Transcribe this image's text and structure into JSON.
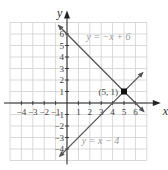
{
  "chart_data": {
    "type": "line",
    "title": "",
    "xlabel": "x",
    "ylabel": "y",
    "xlim": [
      -5,
      7
    ],
    "ylim": [
      -5,
      7
    ],
    "grid": true,
    "x_ticks": [
      -4,
      -3,
      -2,
      -1,
      1,
      2,
      3,
      4,
      5,
      6
    ],
    "y_ticks": [
      -4,
      -3,
      -2,
      -1,
      1,
      2,
      3,
      4,
      5,
      6
    ],
    "x_tick_labels": [
      "−4",
      "−3",
      "−2",
      "−1",
      "1",
      "2",
      "3",
      "4",
      "5",
      "6"
    ],
    "y_tick_labels": [
      "−4",
      "−3",
      "−2",
      "−1",
      "1",
      "2",
      "3",
      "4",
      "5",
      "6"
    ],
    "series": [
      {
        "name": "y = −x + 6",
        "slope": -1,
        "intercept": 6,
        "x": [
          -0.7,
          6.7
        ],
        "y": [
          6.7,
          -0.7
        ],
        "color": "#555555",
        "label_pos": [
          1.7,
          5.5
        ]
      },
      {
        "name": "y = x − 4",
        "slope": 1,
        "intercept": -4,
        "x": [
          -0.6,
          6.6
        ],
        "y": [
          -4.6,
          2.6
        ],
        "color": "#555555",
        "label_pos": [
          1.3,
          -3.6
        ]
      }
    ],
    "annotations": [
      {
        "text": "(5, 1)",
        "x": 5,
        "y": 1,
        "marker": "square"
      }
    ]
  }
}
